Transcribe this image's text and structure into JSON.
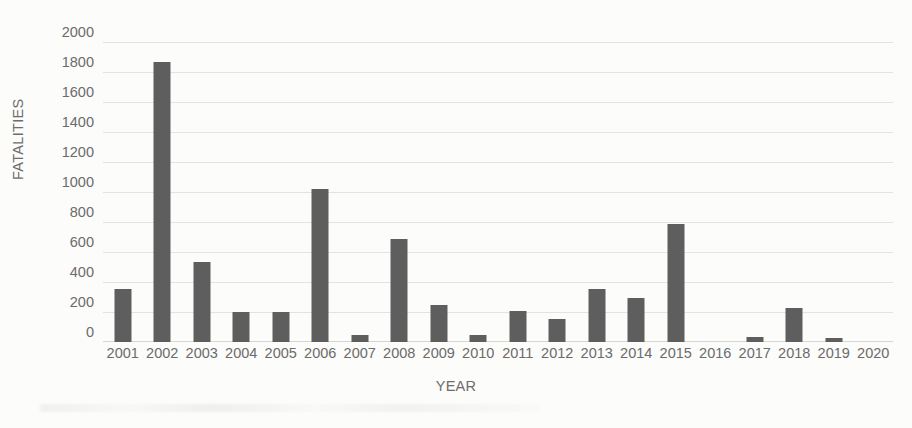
{
  "chart_data": {
    "type": "bar",
    "title": "",
    "xlabel": "YEAR",
    "ylabel": "FATALITIES",
    "categories": [
      "2001",
      "2002",
      "2003",
      "2004",
      "2005",
      "2006",
      "2007",
      "2008",
      "2009",
      "2010",
      "2011",
      "2012",
      "2013",
      "2014",
      "2015",
      "2016",
      "2017",
      "2018",
      "2019",
      "2020"
    ],
    "values": [
      355,
      1865,
      535,
      200,
      200,
      1020,
      50,
      685,
      245,
      45,
      210,
      155,
      355,
      295,
      790,
      0,
      35,
      225,
      25,
      0
    ],
    "series": [
      {
        "name": "Fatalities",
        "values": [
          355,
          1865,
          535,
          200,
          200,
          1020,
          50,
          685,
          245,
          45,
          210,
          155,
          355,
          295,
          790,
          0,
          35,
          225,
          25,
          0
        ]
      }
    ],
    "ylim": [
      0,
      2000
    ],
    "ytick_labels": [
      "2000",
      "1800",
      "1600",
      "1400",
      "1200",
      "1000",
      "800",
      "600",
      "400",
      "200",
      "0"
    ],
    "ytick_values": [
      2000,
      1800,
      1600,
      1400,
      1200,
      1000,
      800,
      600,
      400,
      200,
      0
    ],
    "ystep": 200,
    "grid": true,
    "legend": false,
    "legend_position": "none",
    "bar_color": "#5e5e5e",
    "gridline_color": "#e3e3e0",
    "axis_text_color": "#6b6b6b",
    "background_color": "#fcfcfa"
  }
}
